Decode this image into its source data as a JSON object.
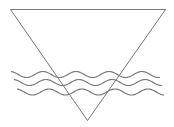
{
  "diagram": {
    "title": "",
    "colors": {
      "background": "#ffffff",
      "stroke": "#777777"
    },
    "shapes": [
      {
        "type": "inverted-triangle",
        "name": "water-triangle"
      },
      {
        "type": "wave",
        "name": "wave-line-1"
      },
      {
        "type": "wave",
        "name": "wave-line-2"
      },
      {
        "type": "wave",
        "name": "wave-line-3"
      }
    ],
    "wave_count": 3
  }
}
